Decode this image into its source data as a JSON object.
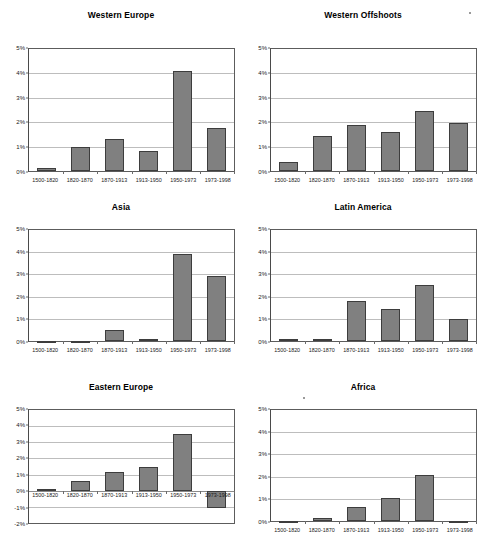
{
  "figure": {
    "panel_count": 6,
    "bar_color": "#808080",
    "bar_border_color": "#3d3d3d",
    "grid_color": "#bdbdbd",
    "axis_color": "#5c5c5c"
  },
  "chart_data": [
    {
      "type": "bar",
      "title": "Western Europe",
      "categories": [
        "1500-1820",
        "1820-1870",
        "1870-1913",
        "1913-1950",
        "1950-1973",
        "1973-1998"
      ],
      "values": [
        0.14,
        0.98,
        1.33,
        0.82,
        4.08,
        1.78
      ],
      "xlabel": "",
      "ylabel": "",
      "ylim": [
        0,
        5
      ],
      "yticks": [
        0,
        1,
        2,
        3,
        4,
        5
      ],
      "ytick_labels": [
        "0%",
        "1%",
        "2%",
        "3%",
        "4%",
        "5%"
      ],
      "grid": true,
      "legend": "none"
    },
    {
      "type": "bar",
      "title": "Western Offshoots",
      "categories": [
        "1500-1820",
        "1820-1870",
        "1870-1913",
        "1913-1950",
        "1950-1973",
        "1973-1998"
      ],
      "values": [
        0.35,
        1.42,
        1.88,
        1.58,
        2.44,
        1.97
      ],
      "xlabel": "",
      "ylabel": "",
      "ylim": [
        0,
        5
      ],
      "yticks": [
        0,
        1,
        2,
        3,
        4,
        5
      ],
      "ytick_labels": [
        "0%",
        "1%",
        "2%",
        "3%",
        "4%",
        "5%"
      ],
      "grid": true,
      "legend": "none"
    },
    {
      "type": "bar",
      "title": "Asia",
      "categories": [
        "1500-1820",
        "1820-1870",
        "1870-1913",
        "1913-1950",
        "1950-1973",
        "1973-1998"
      ],
      "values": [
        0.0,
        0.0,
        0.49,
        0.11,
        3.94,
        2.94
      ],
      "xlabel": "",
      "ylabel": "",
      "ylim": [
        0,
        5
      ],
      "yticks": [
        0,
        1,
        2,
        3,
        4,
        5
      ],
      "ytick_labels": [
        "0%",
        "1%",
        "2%",
        "3%",
        "4%",
        "5%"
      ],
      "grid": true,
      "legend": "none"
    },
    {
      "type": "bar",
      "title": "Latin America",
      "categories": [
        "1500-1820",
        "1820-1870",
        "1870-1913",
        "1913-1950",
        "1950-1973",
        "1973-1998"
      ],
      "values": [
        0.11,
        0.08,
        1.82,
        1.43,
        2.52,
        1.0
      ],
      "xlabel": "",
      "ylabel": "",
      "ylim": [
        0,
        5
      ],
      "yticks": [
        0,
        1,
        2,
        3,
        4,
        5
      ],
      "ytick_labels": [
        "0%",
        "1%",
        "2%",
        "3%",
        "4%",
        "5%"
      ],
      "grid": true,
      "legend": "none"
    },
    {
      "type": "bar",
      "title": "Eastern Europe",
      "categories": [
        "1500-1820",
        "1820-1870",
        "1870-1913",
        "1913-1950",
        "1950-1973",
        "1973-1998"
      ],
      "values": [
        0.1,
        0.63,
        1.15,
        1.5,
        3.49,
        -1.1
      ],
      "xlabel": "",
      "ylabel": "",
      "ylim": [
        -2,
        5
      ],
      "yticks": [
        -2,
        -1,
        0,
        1,
        2,
        3,
        4,
        5
      ],
      "ytick_labels": [
        "-2%",
        "-1%",
        "0%",
        "1%",
        "2%",
        "3%",
        "4%",
        "5%"
      ],
      "grid": true,
      "legend": "none"
    },
    {
      "type": "bar",
      "title": "Africa",
      "categories": [
        "1500-1820",
        "1820-1870",
        "1870-1913",
        "1913-1950",
        "1950-1973",
        "1973-1998"
      ],
      "values": [
        0.01,
        0.12,
        0.64,
        1.02,
        2.07,
        0.0
      ],
      "xlabel": "",
      "ylabel": "",
      "ylim": [
        0,
        5
      ],
      "yticks": [
        0,
        1,
        2,
        3,
        4,
        5
      ],
      "ytick_labels": [
        "0%",
        "1%",
        "2%",
        "3%",
        "4%",
        "5%"
      ],
      "grid": true,
      "legend": "none"
    }
  ]
}
